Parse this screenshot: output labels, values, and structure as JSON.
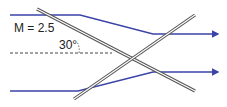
{
  "diagram": {
    "mach_label": "M = 2.5",
    "angle_label": "30°",
    "colors": {
      "flow": "#3a44a8",
      "shock": "#555555",
      "dashed": "#444444"
    },
    "elements": [
      {
        "type": "streamline",
        "name": "upper-streamline"
      },
      {
        "type": "streamline",
        "name": "lower-streamline"
      },
      {
        "type": "shock",
        "name": "oblique-shock-descending"
      },
      {
        "type": "shock",
        "name": "oblique-shock-ascending"
      },
      {
        "type": "reference",
        "name": "centerline-dashed"
      }
    ]
  }
}
